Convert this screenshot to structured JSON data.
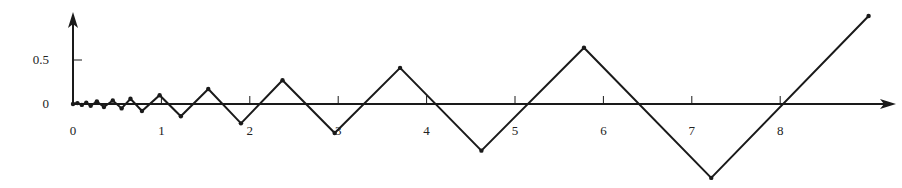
{
  "chart_data": {
    "type": "line",
    "title": "",
    "xlabel": "",
    "ylabel": "",
    "x_ticks": [
      "0",
      "1",
      "2",
      "3",
      "4",
      "5",
      "6",
      "7",
      "8"
    ],
    "y_ticks": [
      "0",
      "0.5"
    ],
    "xlim": [
      0,
      9.3
    ],
    "ylim": [
      -0.9,
      1.05
    ],
    "grid": false,
    "legend": null,
    "series": [
      {
        "name": "zigzag",
        "points": [
          [
            0,
            0
          ],
          [
            0.05,
            0.01
          ],
          [
            0.1,
            -0.01
          ],
          [
            0.15,
            0.015
          ],
          [
            0.2,
            -0.02
          ],
          [
            0.27,
            0.03
          ],
          [
            0.35,
            -0.035
          ],
          [
            0.45,
            0.04
          ],
          [
            0.55,
            -0.05
          ],
          [
            0.65,
            0.06
          ],
          [
            0.78,
            -0.08
          ],
          [
            0.98,
            0.1
          ],
          [
            1.22,
            -0.14
          ],
          [
            1.53,
            0.17
          ],
          [
            1.9,
            -0.22
          ],
          [
            2.37,
            0.27
          ],
          [
            2.96,
            -0.33
          ],
          [
            3.7,
            0.41
          ],
          [
            4.62,
            -0.53
          ],
          [
            5.78,
            0.64
          ],
          [
            7.22,
            -0.84
          ],
          [
            9.0,
            1.0
          ]
        ]
      }
    ]
  }
}
